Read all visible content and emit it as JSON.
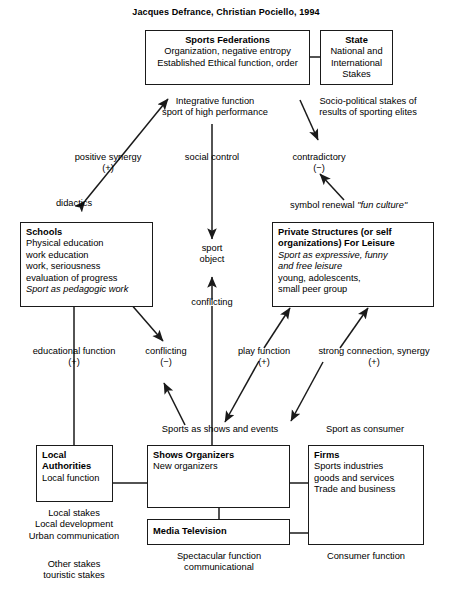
{
  "title": "Jacques Defrance, Christian Pociello, 1994",
  "nodes": {
    "sports_federations": {
      "header": "Sports Federations",
      "line1": "Organization, negative entropy",
      "line2": "Established Ethical function, order"
    },
    "state": {
      "header": "State",
      "line1": "National and",
      "line2": "International",
      "line3": "Stakes"
    },
    "schools": {
      "header": "Schools",
      "line1": "Physical education",
      "line2": "work education",
      "line3": "work, seriousness",
      "line4": "evaluation of progress",
      "line5_italic": "Sport as pedagogic work"
    },
    "private_structures": {
      "header_line1": "Private Structures (or self",
      "header_line2": "organizations) For Leisure",
      "italic_line1": "Sport as expressive, funny",
      "italic_line2": "and free leisure",
      "line3": "young, adolescents,",
      "line4": "small peer group"
    },
    "local_authorities": {
      "header_line1": "Local",
      "header_line2": "Authorities",
      "line1": "Local function"
    },
    "shows_organizers": {
      "header": "Shows Organizers",
      "line1": "New organizers"
    },
    "firms": {
      "header": "Firms",
      "line1": "Sports industries",
      "line2": "goods and services",
      "line3": "Trade and business"
    },
    "media_television": {
      "header": "Media Television"
    }
  },
  "labels": {
    "integrative_function": "Integrative function\nsport of high performance",
    "socio_political": "Socio-political stakes of\nresults of sporting elites",
    "positive_synergy": "positive synergy\n(+)",
    "social_control": "social control",
    "contradictory": "contradictory\n(−)",
    "didactics": "didactics",
    "symbol_renewal_plain": "symbol renewal ",
    "symbol_renewal_italic": "\"fun culture\"",
    "sport_object": "sport\nobject",
    "conflicting_center": "conflicting",
    "educational_function": "educational function\n(+)",
    "conflicting_minus": "conflicting\n(−)",
    "play_function": "play function\n(+)",
    "strong_connection": "strong connection, synergy\n(+)",
    "sports_as_shows": "Sports as shows and events",
    "sport_as_consumer": "Sport as consumer",
    "local_stakes": "Local stakes\nLocal development\nUrban communication",
    "other_stakes": "Other stakes\ntouristic stakes",
    "spectacular_function": "Spectacular function\ncommunicational",
    "consumer_function": "Consumer function"
  },
  "colors": {
    "ink": "#1a1a1a",
    "background": "#ffffff"
  }
}
